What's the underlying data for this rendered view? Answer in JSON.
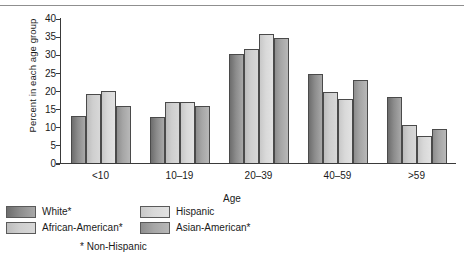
{
  "chart_data": {
    "type": "bar",
    "title": "",
    "xlabel": "Age",
    "ylabel": "Percent in each age group",
    "categories": [
      "<10",
      "10–19",
      "20–39",
      "40–59",
      ">59"
    ],
    "ylim": [
      0,
      40
    ],
    "yticks": [
      0,
      5,
      10,
      15,
      20,
      25,
      30,
      35,
      40
    ],
    "grid": false,
    "legend_position": "below-left",
    "series": [
      {
        "name": "White*",
        "color": "#8c8c8c",
        "values": [
          13.0,
          12.7,
          30.0,
          24.5,
          18.3
        ]
      },
      {
        "name": "African-American*",
        "color": "#cfcfcf",
        "values": [
          19.0,
          16.8,
          31.5,
          19.5,
          10.5
        ]
      },
      {
        "name": "Hispanic",
        "color": "#d9d9d9",
        "values": [
          19.8,
          16.8,
          35.5,
          17.5,
          7.3
        ]
      },
      {
        "name": "Asian-American*",
        "color": "#a6a6a6",
        "values": [
          15.8,
          15.8,
          34.5,
          22.8,
          9.3
        ]
      }
    ],
    "annotations": [
      "* Non-Hispanic"
    ]
  },
  "legend": {
    "left_items": [
      "White*",
      "African-American*"
    ],
    "right_items": [
      "Hispanic",
      "Asian-American*"
    ],
    "footnote": "* Non-Hispanic"
  }
}
